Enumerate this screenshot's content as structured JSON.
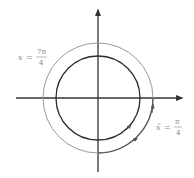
{
  "diagram": {
    "type": "unit-circle-angle-diagram",
    "center": [
      98,
      98
    ],
    "inner_circle_radius": 42,
    "outer_circle_radius": 55,
    "colors": {
      "axis": "#333333",
      "inner_circle": "#2a2a2a",
      "outer_circle": "#9a9a9a",
      "arc_highlight": "#555555",
      "label": "#8a8a8a"
    },
    "labels": {
      "left": {
        "var": "x",
        "eq": "=",
        "numerator": "7π",
        "denominator": "4"
      },
      "right": {
        "var": "x̃",
        "eq": "=",
        "numerator": "π",
        "denominator": "4"
      }
    }
  }
}
